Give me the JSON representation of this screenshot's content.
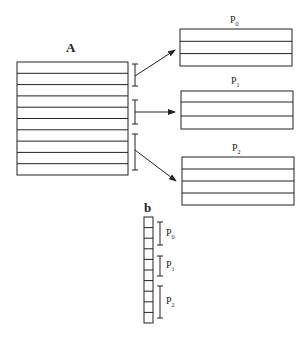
{
  "matrix_label": "A",
  "vector_label": "b",
  "matrix_rows": 10,
  "vector_cells": 10,
  "partitions": [
    {
      "name": "P",
      "sub": "0",
      "rows": 3
    },
    {
      "name": "P",
      "sub": "1",
      "rows": 3
    },
    {
      "name": "P",
      "sub": "2",
      "rows": 4
    }
  ],
  "colors": {
    "stroke": "#222222",
    "background": "#ffffff"
  }
}
